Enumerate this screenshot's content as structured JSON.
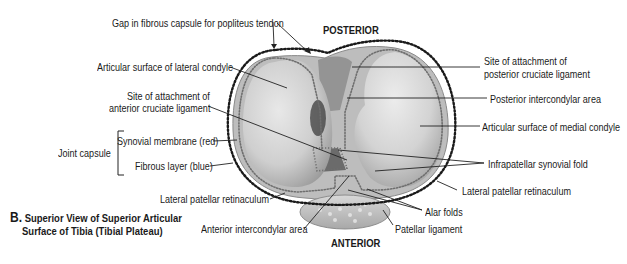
{
  "figure": {
    "letter": "B.",
    "title_line1": "Superior View of Superior Articular",
    "title_line2": "Surface of Tibia (Tibial Plateau)"
  },
  "orientation": {
    "top": "POSTERIOR",
    "bottom": "ANTERIOR"
  },
  "labels_left": {
    "gap_popliteus": "Gap in fibrous capsule for popliteus tendon",
    "lateral_condyle": "Articular surface of lateral condyle",
    "acl_line1": "Site of attachment of",
    "acl_line2": "anterior cruciate ligament",
    "joint_capsule": "Joint capsule",
    "synovial": "Synovial membrane (red)",
    "fibrous": "Fibrous layer (blue)",
    "lat_patellar_ret": "Lateral patellar retinaculum",
    "ant_intercondylar": "Anterior intercondylar area"
  },
  "labels_right": {
    "pcl_line1": "Site of attachment of",
    "pcl_line2": "posterior cruciate ligament",
    "post_intercondylar": "Posterior intercondylar area",
    "medial_condyle": "Articular surface of medial condyle",
    "infrapatellar": "Infrapatellar synovial fold",
    "lat_patellar_ret": "Lateral patellar retinaculum",
    "alar_folds": "Alar folds",
    "patellar_ligament": "Patellar ligament"
  },
  "colors": {
    "plateau_fill": "#c9c9c9",
    "condyle_fill": "#dedede",
    "dark_shadow": "#5a5a5a",
    "outline_dots": "#1a1a1a",
    "synovial_dots": "#6e6e6e",
    "leader": "#222222"
  }
}
